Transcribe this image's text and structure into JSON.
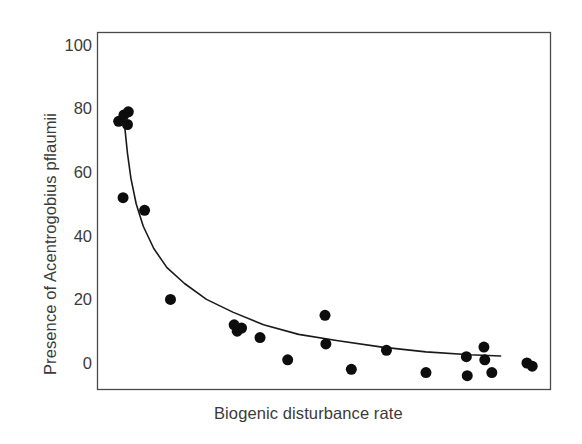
{
  "chart_data": {
    "type": "scatter",
    "title": "",
    "subtitle": "",
    "xlabel": "Biogenic disturbance rate",
    "ylabel": "Presence of Acentrogobius pflaumii",
    "xlim": [
      0,
      1
    ],
    "ylim": [
      -10,
      105
    ],
    "grid": false,
    "legend": null,
    "x_tick_labels": [],
    "y_tick_labels": [
      "100",
      "80",
      "60",
      "40",
      "20",
      "0"
    ],
    "y_ticks": [
      100,
      80,
      60,
      40,
      20,
      0
    ],
    "marker": {
      "shape": "filled-circle",
      "color": "#0d0d0d",
      "size_px": 11
    },
    "series": [
      {
        "name": "observations",
        "points": [
          {
            "x": 0.03,
            "y": 76
          },
          {
            "x": 0.042,
            "y": 78
          },
          {
            "x": 0.05,
            "y": 75
          },
          {
            "x": 0.052,
            "y": 79
          },
          {
            "x": 0.04,
            "y": 52
          },
          {
            "x": 0.089,
            "y": 48
          },
          {
            "x": 0.148,
            "y": 20
          },
          {
            "x": 0.293,
            "y": 12
          },
          {
            "x": 0.3,
            "y": 10
          },
          {
            "x": 0.31,
            "y": 11
          },
          {
            "x": 0.352,
            "y": 8
          },
          {
            "x": 0.415,
            "y": 1
          },
          {
            "x": 0.5,
            "y": 15
          },
          {
            "x": 0.502,
            "y": 6
          },
          {
            "x": 0.56,
            "y": -2
          },
          {
            "x": 0.64,
            "y": 4
          },
          {
            "x": 0.73,
            "y": -3
          },
          {
            "x": 0.822,
            "y": 2
          },
          {
            "x": 0.824,
            "y": -4
          },
          {
            "x": 0.862,
            "y": 5
          },
          {
            "x": 0.864,
            "y": 1
          },
          {
            "x": 0.88,
            "y": -3
          },
          {
            "x": 0.96,
            "y": 0
          },
          {
            "x": 0.972,
            "y": -1
          }
        ]
      }
    ],
    "fit_curve": {
      "name": "decay-fit",
      "style": "solid",
      "color": "#1a1a1a",
      "width_px": 1.6,
      "description": "monotonic decreasing power/exponential decay curve",
      "points": [
        {
          "x": 0.044,
          "y": 74
        },
        {
          "x": 0.05,
          "y": 66
        },
        {
          "x": 0.058,
          "y": 58
        },
        {
          "x": 0.07,
          "y": 50
        },
        {
          "x": 0.086,
          "y": 43
        },
        {
          "x": 0.11,
          "y": 36
        },
        {
          "x": 0.14,
          "y": 30
        },
        {
          "x": 0.18,
          "y": 25
        },
        {
          "x": 0.23,
          "y": 20
        },
        {
          "x": 0.29,
          "y": 16
        },
        {
          "x": 0.36,
          "y": 12
        },
        {
          "x": 0.44,
          "y": 9
        },
        {
          "x": 0.53,
          "y": 7
        },
        {
          "x": 0.63,
          "y": 5
        },
        {
          "x": 0.73,
          "y": 3.5
        },
        {
          "x": 0.83,
          "y": 2.6
        },
        {
          "x": 0.9,
          "y": 2.2
        }
      ]
    },
    "frame": {
      "visible_sides": [
        "top",
        "right",
        "bottom",
        "left"
      ],
      "color": "#4a4a4a"
    }
  }
}
